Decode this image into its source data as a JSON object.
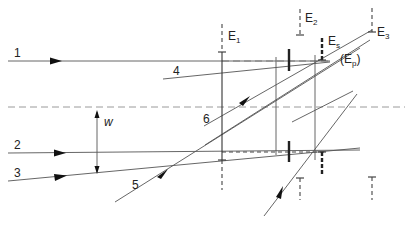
{
  "diagram": {
    "rays": [
      {
        "id": "1",
        "label": "1"
      },
      {
        "id": "2",
        "label": "2"
      },
      {
        "id": "3",
        "label": "3"
      },
      {
        "id": "4",
        "label": "4"
      },
      {
        "id": "5",
        "label": "5"
      },
      {
        "id": "6",
        "label": "6"
      }
    ],
    "elements": {
      "E1": {
        "base": "E",
        "sub": "1"
      },
      "E2": {
        "base": "E",
        "sub": "2"
      },
      "E3": {
        "base": "E",
        "sub": "3"
      },
      "Es": {
        "base": "E",
        "sub": "s"
      },
      "Ep": {
        "open": "(E",
        "sub": "p",
        "close": ")"
      }
    },
    "width_label": "w"
  }
}
